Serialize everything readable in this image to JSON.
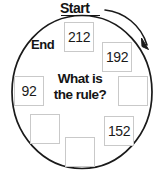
{
  "diagram": {
    "title_label": "Start",
    "end_label": "End",
    "question_line1": "What is",
    "question_line2": "the rule?",
    "circle": {
      "cx": 82,
      "cy": 92,
      "rx": 70,
      "ry": 77,
      "stroke": "#1a1a1a",
      "stroke_width": 1.6,
      "fill": "#ffffff"
    },
    "arrow": {
      "name": "clockwise-direction-arrow",
      "stroke": "#1a1a1a",
      "stroke_width": 1.5,
      "description": "curved arrow sweeping clockwise from Start label to upper right of circle"
    },
    "start_underline": {
      "x1": 60,
      "x2": 100,
      "y": 16,
      "stroke": "#141414"
    },
    "cells": [
      {
        "name": "cell-top",
        "value": "212",
        "empty": false,
        "x": 64,
        "y": 22,
        "w": 30,
        "h": 30
      },
      {
        "name": "cell-upper-right",
        "value": "192",
        "empty": false,
        "x": 102,
        "y": 42,
        "w": 30,
        "h": 30
      },
      {
        "name": "cell-right",
        "value": "",
        "empty": true,
        "x": 118,
        "y": 76,
        "w": 30,
        "h": 30
      },
      {
        "name": "cell-lower-right",
        "value": "152",
        "empty": false,
        "x": 104,
        "y": 116,
        "w": 30,
        "h": 30
      },
      {
        "name": "cell-bottom",
        "value": "",
        "empty": true,
        "x": 65,
        "y": 137,
        "w": 30,
        "h": 30
      },
      {
        "name": "cell-lower-left",
        "value": "",
        "empty": true,
        "x": 30,
        "y": 114,
        "w": 30,
        "h": 30
      },
      {
        "name": "cell-left",
        "value": "92",
        "empty": true,
        "x": 14,
        "y": 76,
        "w": 30,
        "h": 30
      }
    ],
    "cell_values": {
      "top": "212",
      "upper_right": "192",
      "right": "",
      "lower_right": "152",
      "bottom": "",
      "lower_left": "",
      "left": "92"
    },
    "colors": {
      "cell_border": "#c9c9c9",
      "cell_fill": "#ffffff",
      "text": "#141414",
      "outline": "#1a1a1a"
    }
  }
}
